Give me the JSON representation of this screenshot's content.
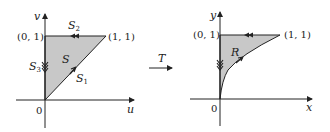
{
  "left": {
    "axis_v": "v",
    "axis_u": "u",
    "origin": "0",
    "point_top": "(0, 1)",
    "point_corner": "(1, 1)",
    "region": "S",
    "edges": [
      {
        "name": "S",
        "sub": "1"
      },
      {
        "name": "S",
        "sub": "2"
      },
      {
        "name": "S",
        "sub": "3"
      }
    ]
  },
  "transform": {
    "label": "T"
  },
  "right": {
    "axis_y": "y",
    "axis_x": "x",
    "origin": "0",
    "point_top": "(0, 1)",
    "point_corner": "(1, 1)",
    "region": "R"
  },
  "colors": {
    "fill": "#c8c8c8",
    "line": "#222222"
  }
}
